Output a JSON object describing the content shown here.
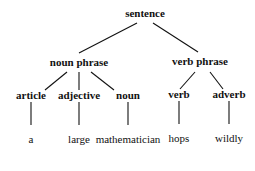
{
  "tree": {
    "root": {
      "label": "sentence",
      "x": 145,
      "y": 7
    },
    "phrases": [
      {
        "label": "noun phrase",
        "x": 79,
        "y": 56
      },
      {
        "label": "verb phrase",
        "x": 200,
        "y": 55
      }
    ],
    "pos": [
      {
        "label": "article",
        "x": 31,
        "y": 89
      },
      {
        "label": "adjective",
        "x": 79,
        "y": 89
      },
      {
        "label": "noun",
        "x": 128,
        "y": 89
      },
      {
        "label": "verb",
        "x": 179,
        "y": 88
      },
      {
        "label": "adverb",
        "x": 229,
        "y": 88
      }
    ],
    "words": [
      {
        "label": "a",
        "x": 31,
        "y": 133
      },
      {
        "label": "large",
        "x": 79,
        "y": 133
      },
      {
        "label": "mathematician",
        "x": 128,
        "y": 133
      },
      {
        "label": "hops",
        "x": 179,
        "y": 132
      },
      {
        "label": "wildly",
        "x": 229,
        "y": 132
      }
    ],
    "edges": [
      [
        137,
        23,
        79,
        53
      ],
      [
        153,
        23,
        198,
        52
      ],
      [
        67,
        72,
        45,
        90
      ],
      [
        79,
        72,
        79,
        90
      ],
      [
        91,
        72,
        114,
        90
      ],
      [
        195,
        72,
        180,
        89
      ],
      [
        210,
        72,
        223,
        89
      ],
      [
        31,
        102,
        31,
        125
      ],
      [
        79,
        102,
        79,
        125
      ],
      [
        128,
        102,
        128,
        125
      ],
      [
        179,
        101,
        179,
        124
      ],
      [
        229,
        101,
        229,
        124
      ]
    ]
  }
}
